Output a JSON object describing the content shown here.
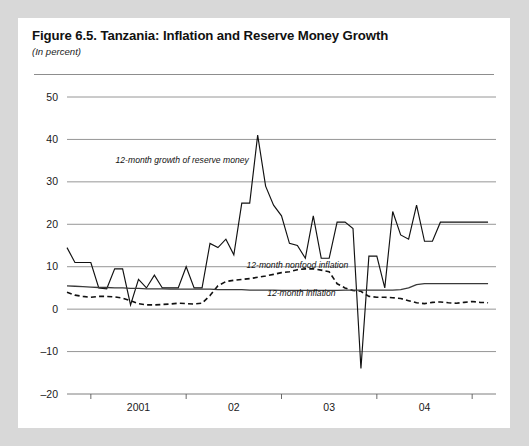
{
  "figure": {
    "title": "Figure 6.5. Tanzania: Inflation and Reserve Money Growth",
    "subtitle": "(In percent)"
  },
  "chart_data": {
    "type": "line",
    "title": "Figure 6.5. Tanzania: Inflation and Reserve Money Growth",
    "subtitle": "(In percent)",
    "xlabel": "",
    "ylabel": "",
    "ylim": [
      -20,
      50
    ],
    "yticks": [
      -20,
      -10,
      0,
      10,
      20,
      30,
      40,
      50
    ],
    "ytick_labels": [
      "-20",
      "-10",
      "0",
      "10",
      "20",
      "30",
      "40",
      "50"
    ],
    "xlim": [
      0,
      54
    ],
    "xtick_positions": [
      3,
      15,
      27,
      39,
      51
    ],
    "xtick_category_labels": [
      "2001",
      "02",
      "03",
      "04"
    ],
    "xtick_label_positions": [
      9,
      21,
      33,
      45
    ],
    "grid": true,
    "legend_position": "inline-annotations",
    "annotations": [
      {
        "text": "12-month growth of reserve money",
        "x": 14.5,
        "y": 34.5,
        "series": "reserve_money"
      },
      {
        "text": "12-month nonfood inflation",
        "x": 29.0,
        "y": 9.6,
        "series": "nonfood_inflation"
      },
      {
        "text": "12-month inflation",
        "x": 29.5,
        "y": 3.1,
        "series": "inflation"
      }
    ],
    "series": [
      {
        "name": "12-month growth of reserve money",
        "style": "solid-thin",
        "color": "#111111",
        "x": [
          0,
          1,
          2,
          3,
          4,
          5,
          6,
          7,
          8,
          9,
          10,
          11,
          12,
          13,
          14,
          15,
          16,
          17,
          18,
          19,
          20,
          21,
          22,
          23,
          24,
          25,
          26,
          27,
          28,
          29,
          30,
          31,
          32,
          33,
          34,
          35,
          36,
          37,
          38,
          39,
          40,
          41,
          42,
          43,
          44,
          45,
          46,
          47,
          48,
          49,
          50,
          51,
          52,
          53
        ],
        "values": [
          14.5,
          11.0,
          11.0,
          11.0,
          5.0,
          4.8,
          9.5,
          9.5,
          1.0,
          7.0,
          5.0,
          8.0,
          5.0,
          5.0,
          5.0,
          10.0,
          5.0,
          5.0,
          15.5,
          14.5,
          16.5,
          12.8,
          25.0,
          25.0,
          41.0,
          29.0,
          24.5,
          22.0,
          15.5,
          15.0,
          12.0,
          22.0,
          12.0,
          12.0,
          20.5,
          20.5,
          19.0,
          -14.0,
          12.5,
          12.5,
          5.0,
          23.0,
          17.5,
          16.5,
          24.5,
          16.0,
          16.0,
          20.5,
          20.5,
          20.5,
          20.5,
          20.5,
          20.5,
          20.5
        ]
      },
      {
        "name": "12-month nonfood inflation",
        "style": "dashed",
        "color": "#111111",
        "x": [
          0,
          1,
          2,
          3,
          4,
          5,
          6,
          7,
          8,
          9,
          10,
          11,
          12,
          13,
          14,
          15,
          16,
          17,
          18,
          19,
          20,
          21,
          22,
          23,
          24,
          25,
          26,
          27,
          28,
          29,
          30,
          31,
          32,
          33,
          34,
          35,
          36,
          37,
          38,
          39,
          40,
          41,
          42,
          43,
          44,
          45,
          46,
          47,
          48,
          49,
          50,
          51,
          52,
          53
        ],
        "values": [
          4.0,
          3.3,
          3.0,
          2.8,
          3.0,
          3.0,
          2.9,
          2.6,
          2.0,
          1.3,
          1.0,
          1.0,
          1.1,
          1.2,
          1.4,
          1.3,
          1.2,
          1.4,
          3.2,
          5.5,
          6.5,
          6.8,
          7.0,
          7.2,
          7.5,
          7.8,
          8.2,
          8.6,
          8.8,
          9.3,
          9.5,
          9.5,
          9.2,
          8.8,
          6.0,
          5.0,
          4.4,
          4.2,
          3.0,
          2.8,
          2.8,
          2.7,
          2.5,
          2.0,
          1.5,
          1.3,
          1.6,
          1.7,
          1.5,
          1.4,
          1.6,
          1.8,
          1.6,
          1.5
        ]
      },
      {
        "name": "12-month inflation",
        "style": "flat-solid",
        "color": "#3a3a3a",
        "x": [
          0,
          1,
          2,
          3,
          4,
          5,
          6,
          7,
          8,
          9,
          10,
          11,
          12,
          13,
          14,
          15,
          16,
          17,
          18,
          19,
          20,
          21,
          22,
          23,
          24,
          25,
          26,
          27,
          28,
          29,
          30,
          31,
          32,
          33,
          34,
          35,
          36,
          37,
          38,
          39,
          40,
          41,
          42,
          43,
          44,
          45,
          46,
          47,
          48,
          49,
          50,
          51,
          52,
          53
        ],
        "values": [
          5.5,
          5.4,
          5.3,
          5.2,
          5.1,
          5.1,
          5.0,
          5.0,
          4.9,
          4.9,
          4.8,
          4.8,
          4.8,
          4.7,
          4.7,
          4.7,
          4.7,
          4.7,
          4.7,
          4.6,
          4.6,
          4.6,
          4.6,
          4.5,
          4.5,
          4.5,
          4.5,
          4.4,
          4.4,
          4.4,
          4.4,
          4.4,
          4.4,
          4.4,
          4.4,
          4.5,
          4.5,
          4.5,
          4.5,
          4.5,
          4.5,
          4.5,
          4.6,
          5.0,
          5.8,
          6.0,
          6.0,
          6.0,
          6.0,
          6.0,
          6.0,
          6.0,
          6.0,
          6.0
        ]
      }
    ]
  },
  "colors": {
    "page_background": "#d8d8d8",
    "card_background": "#ffffff",
    "gridline": "#8a8a8a",
    "text": "#111111"
  }
}
